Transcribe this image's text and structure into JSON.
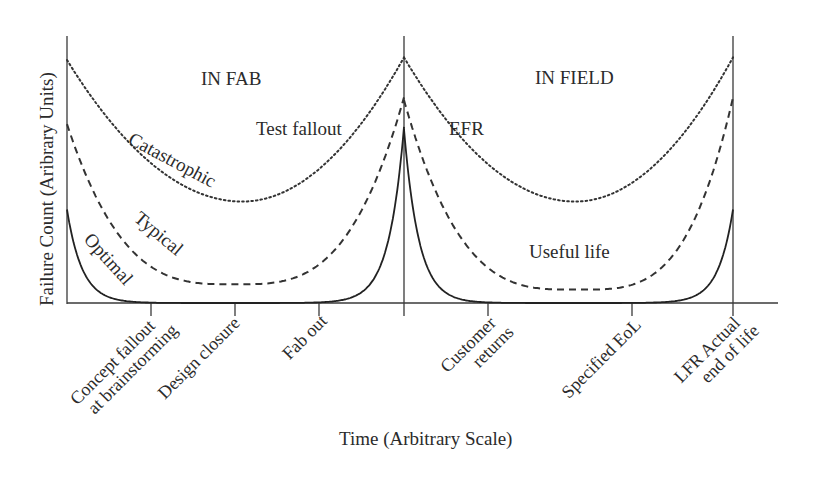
{
  "chart_data": {
    "type": "line",
    "title": "",
    "xlabel": "Time (Arbitrary Scale)",
    "ylabel": "Failure Count (Aribrary Units)",
    "grid": false,
    "legend": "inline curve labels",
    "regions": [
      {
        "name": "IN FAB",
        "x_range": [
          0,
          1
        ]
      },
      {
        "name": "IN FIELD",
        "x_range": [
          1,
          2
        ]
      }
    ],
    "x_ticks": [
      {
        "x": 0.25,
        "label": "Concept fallout\nat brainstorming"
      },
      {
        "x": 0.5,
        "label": "Design closure"
      },
      {
        "x": 0.75,
        "label": "Fab out"
      },
      {
        "x": 1.0,
        "label": ""
      },
      {
        "x": 1.25,
        "label": "Customer\nreturns"
      },
      {
        "x": 1.69,
        "label": "Specified EoL"
      },
      {
        "x": 2.0,
        "label": "LFR Actual\nend of life"
      }
    ],
    "series": [
      {
        "name": "Catastrophic",
        "style": "dotted",
        "description": "bathtub curve in each region, high minimum",
        "fab": {
          "start": 0.91,
          "min": 0.38,
          "min_x": 0.52,
          "end": 0.92
        },
        "field": {
          "start": 0.92,
          "min": 0.38,
          "min_x": 1.52,
          "end": 0.92
        }
      },
      {
        "name": "Typical",
        "style": "dashed",
        "description": "bathtub curve in each region, low minimum",
        "fab": {
          "start": 0.67,
          "min": 0.07,
          "min_x": 0.5,
          "end": 0.77
        },
        "field": {
          "start": 0.76,
          "min": 0.05,
          "min_x": 1.52,
          "end": 0.77
        }
      },
      {
        "name": "Optimal",
        "style": "solid",
        "description": "sharp exponential spikes at region boundaries, near zero in between",
        "fab": {
          "start": 0.35,
          "min": 0.0,
          "end": 0.66
        },
        "field": {
          "start": 0.65,
          "min": 0.0,
          "end": 0.35
        }
      }
    ],
    "annotations": [
      "IN FAB",
      "IN FIELD",
      "Test fallout",
      "EFR",
      "Useful life",
      "Catastrophic",
      "Typical",
      "Optimal"
    ],
    "ylim": [
      0,
      1
    ],
    "xlim": [
      0,
      2.14
    ]
  },
  "labels": {
    "ylabel": "Failure Count (Aribrary Units)",
    "xlabel": "Time (Arbitrary Scale)",
    "region_fab": "IN FAB",
    "region_field": "IN FIELD",
    "test_fallout": "Test fallout",
    "efr": "EFR",
    "useful_life": "Useful life",
    "catastrophic": "Catastrophic",
    "typical": "Typical",
    "optimal": "Optimal",
    "tick_concept_1": "Concept fallout",
    "tick_concept_2": "at brainstorming",
    "tick_design": "Design closure",
    "tick_fabout": "Fab out",
    "tick_customer_1": "Customer",
    "tick_customer_2": "returns",
    "tick_eol": "Specified EoL",
    "tick_lfr_1": "LFR Actual",
    "tick_lfr_2": "end of life"
  }
}
